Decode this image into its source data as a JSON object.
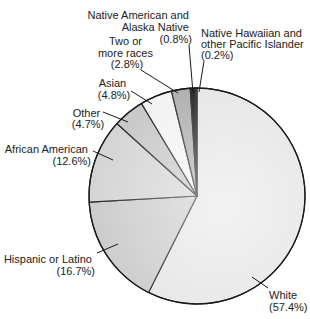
{
  "chart_data": {
    "type": "pie",
    "title": "",
    "start_angle_deg": 0,
    "direction": "clockwise",
    "slices": [
      {
        "label": "White",
        "value": 57.4,
        "pct_text": "(57.4%)",
        "color": "#e4e4e4"
      },
      {
        "label": "Hispanic or Latino",
        "value": 16.7,
        "pct_text": "(16.7%)",
        "color": "#c8c8c8"
      },
      {
        "label": "African American",
        "value": 12.6,
        "pct_text": "(12.6%)",
        "color": "#d2d2d2"
      },
      {
        "label": "Other",
        "value": 4.7,
        "pct_text": "(4.7%)",
        "color": "#c4c4c4"
      },
      {
        "label": "Asian",
        "value": 4.8,
        "pct_text": "(4.8%)",
        "color": "#f2f2f2"
      },
      {
        "label": "Two or more races",
        "value": 2.8,
        "pct_text": "(2.8%)",
        "color": "#a8a8a8"
      },
      {
        "label": "Native American and Alaska Native",
        "value": 0.8,
        "pct_text": "(0.8%)",
        "color": "#111111"
      },
      {
        "label": "Native Hawaiian and other Pacific Islander",
        "value": 0.2,
        "pct_text": "(0.2%)",
        "color": "#8a8a8a"
      }
    ],
    "legend": "none (direct labels with leader lines)"
  },
  "labels": {
    "white": {
      "line1": "White",
      "line2": "(57.4%)"
    },
    "hispanic": {
      "line1": "Hispanic or Latino",
      "line2": "(16.7%)"
    },
    "african_american": {
      "line1": "African American",
      "line2": "(12.6%)"
    },
    "other": {
      "line1": "Other",
      "line2": "(4.7%)"
    },
    "asian": {
      "line1": "Asian",
      "line2": "(4.8%)"
    },
    "two_or_more": {
      "line1": "Two or",
      "line2": "more races",
      "line3": "(2.8%)"
    },
    "native_american": {
      "line1": "Native American and",
      "line2": "Alaska Native",
      "line3": "(0.8%)"
    },
    "native_hawaiian": {
      "line1": "Native Hawaiian and",
      "line2": "other Pacific Islander",
      "line3": "(0.2%)"
    }
  }
}
